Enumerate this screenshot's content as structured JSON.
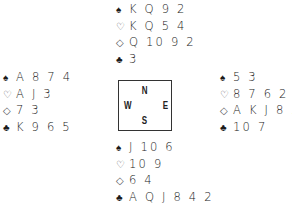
{
  "diagram": {
    "type": "bridge-deal",
    "suit_symbols": {
      "spades": "♠",
      "hearts": "♡",
      "diamonds": "◇",
      "clubs": "♣"
    },
    "compass": {
      "north": "N",
      "south": "S",
      "east": "E",
      "west": "W"
    },
    "hands": {
      "north": {
        "spades": "K Q 9 2",
        "hearts": "K Q 5 4",
        "diamonds": "Q 10 9 2",
        "clubs": "3"
      },
      "west": {
        "spades": "A 8 7 4",
        "hearts": "A J 3",
        "diamonds": "7 3",
        "clubs": "K 9 6 5"
      },
      "east": {
        "spades": "5 3",
        "hearts": "8 7 6 2",
        "diamonds": "A K J 8 5",
        "clubs": "10 7"
      },
      "south": {
        "spades": "J 10 6",
        "hearts": "10 9",
        "diamonds": "6 4",
        "clubs": "A Q J 8 4 2"
      }
    }
  }
}
